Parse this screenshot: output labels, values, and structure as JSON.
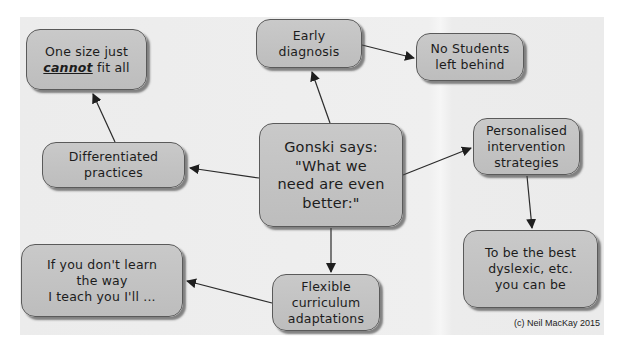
{
  "diagram": {
    "type": "concept-map",
    "colors": {
      "panel_bg": "#ececec",
      "node_fill": "#c4c4c4",
      "node_border": "#5a5a5a",
      "edge": "#2a2a2a",
      "text": "#1c1c1c"
    },
    "nodes": {
      "center": {
        "lines": [
          "Gonski says:",
          "\"What we",
          "need are even",
          "better:\""
        ]
      },
      "one_size": {
        "line1": "One size just",
        "line2_emph": "cannot",
        "line2_rest": " fit all"
      },
      "early": {
        "lines": [
          "Early",
          "diagnosis"
        ]
      },
      "no_students": {
        "lines": [
          "No Students",
          "left behind"
        ]
      },
      "differentiated": {
        "lines": [
          "Differentiated",
          "practices"
        ]
      },
      "personalised": {
        "lines": [
          "Personalised",
          "intervention",
          "strategies"
        ]
      },
      "best": {
        "lines": [
          "To be the best",
          "dyslexic, etc.",
          "you can be"
        ]
      },
      "flexible": {
        "lines": [
          "Flexible",
          "curriculum",
          "adaptations"
        ]
      },
      "if_you": {
        "lines": [
          "If you don't learn",
          "the way",
          "I teach you I'll ..."
        ]
      }
    },
    "edges": [
      {
        "from": "center",
        "to": "early"
      },
      {
        "from": "early",
        "to": "no_students"
      },
      {
        "from": "center",
        "to": "differentiated"
      },
      {
        "from": "differentiated",
        "to": "one_size"
      },
      {
        "from": "center",
        "to": "personalised"
      },
      {
        "from": "personalised",
        "to": "best"
      },
      {
        "from": "center",
        "to": "flexible"
      },
      {
        "from": "flexible",
        "to": "if_you"
      }
    ],
    "credit": "(c) Neil MacKay 2015"
  }
}
